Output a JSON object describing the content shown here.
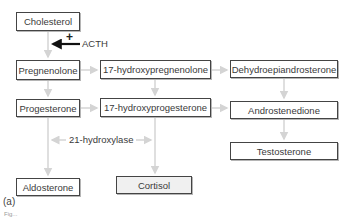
{
  "nodes": {
    "cholesterol": "Cholesterol",
    "pregnenolone": "Pregnenolone",
    "hydroxypregnenolone": "17-hydroxypregnenolone",
    "dhea": "Dehydroepiandrosterone",
    "progesterone": "Progesterone",
    "hydroxyprogesterone": "17-hydroxyprogesterone",
    "androstenedione": "Androstenedione",
    "testosterone": "Testosterone",
    "aldosterone": "Aldosterone",
    "cortisol": "Cortisol"
  },
  "labels": {
    "acth": "ACTH",
    "acth_sign": "+",
    "enzyme": "21-hydroxylase",
    "panel": "(a)",
    "figure_caption": "Fig..."
  },
  "colors": {
    "arrow_faint": "#d4d4d4",
    "arrow_strong": "#111111",
    "box_border": "#444444"
  }
}
